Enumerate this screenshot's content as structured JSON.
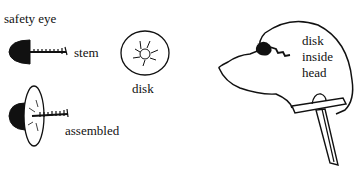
{
  "diagram": {
    "labels": {
      "safety_eye": "safety eye",
      "stem": "stem",
      "disk": "disk",
      "assembled": "assembled",
      "inside_line1": "disk",
      "inside_line2": "inside",
      "inside_line3": "head"
    },
    "colors": {
      "ink": "#111111",
      "background": "#ffffff"
    }
  }
}
